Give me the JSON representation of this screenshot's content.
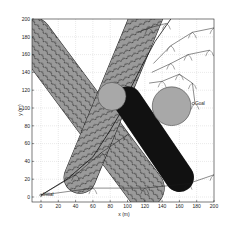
{
  "figure": {
    "xlabel": "x (m)",
    "ylabel": "y (m)",
    "annotations": {
      "initial": "Initial",
      "goal": "Goal"
    }
  },
  "chart_data": {
    "type": "scatter",
    "title": "",
    "xlabel": "x (m)",
    "ylabel": "y (m)",
    "xlim": [
      -10,
      200
    ],
    "ylim": [
      -5,
      200
    ],
    "xticks": [
      0,
      20,
      40,
      60,
      80,
      100,
      120,
      140,
      160,
      180,
      200
    ],
    "yticks": [
      0,
      20,
      40,
      60,
      80,
      100,
      120,
      140,
      160,
      180,
      200
    ],
    "grid": true,
    "grid_style": "dotted",
    "colors": {
      "obstacle_band": "#9a9a9a",
      "moving_obstacle": "#111111",
      "static_circle": "#a8a8a8",
      "tree_edge": "#1a1a1a",
      "axis": "#222222"
    },
    "obstacles": [
      {
        "name": "band-diagonal-down",
        "shape": "capsule",
        "from": [
          -10,
          180
        ],
        "to": [
          120,
          10
        ],
        "width": 44
      },
      {
        "name": "band-diagonal-up",
        "shape": "capsule",
        "from": [
          45,
          22
        ],
        "to": [
          125,
          210
        ],
        "width": 36
      },
      {
        "name": "band-moving-dark",
        "shape": "capsule",
        "from": [
          100,
          108
        ],
        "to": [
          160,
          22
        ],
        "width": 32
      },
      {
        "name": "circle-center",
        "shape": "circle",
        "center": [
          82,
          113
        ],
        "radius": 16
      },
      {
        "name": "circle-goal-side",
        "shape": "circle",
        "center": [
          151,
          102
        ],
        "radius": 22
      }
    ],
    "initial_point": [
      0,
      2
    ],
    "goal_point": [
      176,
      105
    ],
    "path": [
      [
        0,
        2
      ],
      [
        30,
        20
      ],
      [
        60,
        45
      ],
      [
        80,
        75
      ],
      [
        95,
        100
      ],
      [
        105,
        125
      ],
      [
        118,
        150
      ],
      [
        132,
        175
      ],
      [
        150,
        200
      ]
    ],
    "tree_branches": [
      [
        [
          0,
          2
        ],
        [
          60,
          10
        ],
        [
          120,
          10
        ],
        [
          170,
          15
        ],
        [
          200,
          25
        ]
      ],
      [
        [
          0,
          2
        ],
        [
          40,
          25
        ],
        [
          70,
          50
        ],
        [
          100,
          70
        ]
      ],
      [
        [
          130,
          150
        ],
        [
          150,
          170
        ],
        [
          175,
          185
        ],
        [
          200,
          190
        ]
      ],
      [
        [
          128,
          140
        ],
        [
          150,
          150
        ],
        [
          170,
          160
        ],
        [
          195,
          165
        ]
      ],
      [
        [
          125,
          128
        ],
        [
          140,
          130
        ],
        [
          160,
          138
        ],
        [
          175,
          128
        ],
        [
          178,
          105
        ]
      ],
      [
        [
          112,
          185
        ],
        [
          125,
          190
        ],
        [
          145,
          195
        ]
      ]
    ]
  }
}
